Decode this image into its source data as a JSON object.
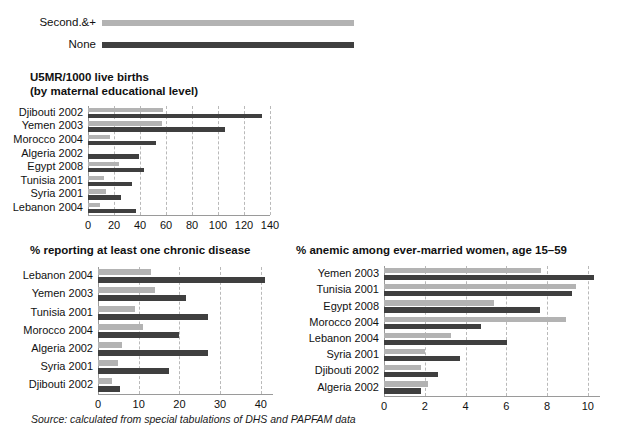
{
  "legend": {
    "items": [
      {
        "label": "Second.&+",
        "style": "light",
        "color": "#b3b3b3"
      },
      {
        "label": "None",
        "style": "dark",
        "color": "#3f3f3f"
      }
    ]
  },
  "source": {
    "text": "Source: calculated from special tabulations of DHS and PAPFAM data"
  },
  "colors": {
    "light_bar": "#b3b3b3",
    "dark_bar": "#3f3f3f",
    "gridline": "#b9b9b9",
    "axis": "#9a9a9a"
  },
  "charts": {
    "u5mr": {
      "title_line1": "U5MR/1000 live births",
      "title_line2": "(by maternal educational level)",
      "categories": [
        "Djibouti 2002",
        "Yemen 2003",
        "Morocco 2004",
        "Algeria 2002",
        "Egypt 2008",
        "Tunisia 2001",
        "Syria 2001",
        "Lebanon 2004"
      ],
      "ticks": [
        "0",
        "20",
        "40",
        "60",
        "80",
        "100",
        "120",
        "140"
      ],
      "tick_values": [
        0,
        20,
        40,
        60,
        80,
        100,
        120,
        140
      ],
      "xmin": 0,
      "xmax": 140,
      "series": [
        {
          "name": "Second.&+",
          "style": "light",
          "values": [
            58,
            57,
            17,
            1,
            24,
            12,
            14,
            9
          ]
        },
        {
          "name": "None",
          "style": "dark",
          "values": [
            134,
            105,
            52,
            39,
            43,
            34,
            25,
            37
          ]
        }
      ]
    },
    "chronic": {
      "title_line1": "% reporting at least one chronic disease",
      "title_line2": "",
      "categories": [
        "Lebanon 2004",
        "Yemen 2003",
        "Tunisia 2001",
        "Morocco 2004",
        "Algeria 2002",
        "Syria 2001",
        "Djibouti 2002"
      ],
      "ticks": [
        "0",
        "10",
        "20",
        "30",
        "40"
      ],
      "tick_values": [
        0,
        10,
        20,
        30,
        40
      ],
      "xmin": 0,
      "xmax": 43,
      "series": [
        {
          "name": "Second.&+",
          "style": "light",
          "values": [
            13,
            14,
            9,
            11,
            6,
            5,
            3.5
          ]
        },
        {
          "name": "None",
          "style": "dark",
          "values": [
            41,
            21.5,
            27,
            20,
            27,
            17.5,
            5.5
          ]
        }
      ]
    },
    "anemia": {
      "title_line1": "% anemic among ever-married women, age 15–59",
      "title_line2": "",
      "categories": [
        "Yemen 2003",
        "Tunisia 2001",
        "Egypt 2008",
        "Morocco 2004",
        "Lebanon 2004",
        "Syria 2001",
        "Djibouti 2002",
        "Algeria 2002"
      ],
      "ticks": [
        "0",
        "2",
        "4",
        "6",
        "8",
        "10"
      ],
      "tick_values": [
        0,
        2,
        4,
        6,
        8,
        10
      ],
      "xmin": 0,
      "xmax": 10.6,
      "series": [
        {
          "name": "Second.&+",
          "style": "light",
          "values": [
            7.7,
            9.4,
            5.4,
            8.95,
            3.3,
            2.0,
            1.8,
            2.15
          ]
        },
        {
          "name": "None",
          "style": "dark",
          "values": [
            10.3,
            9.25,
            7.65,
            4.75,
            6.05,
            3.75,
            2.65,
            1.8
          ]
        }
      ]
    }
  },
  "chart_data": [
    {
      "type": "bar",
      "orientation": "horizontal",
      "title": "U5MR/1000 live births (by maternal educational level)",
      "xlabel": "",
      "ylabel": "",
      "xlim": [
        0,
        140
      ],
      "grid": true,
      "legend_position": "top",
      "categories": [
        "Djibouti 2002",
        "Yemen 2003",
        "Morocco 2004",
        "Algeria 2002",
        "Egypt 2008",
        "Tunisia 2001",
        "Syria 2001",
        "Lebanon 2004"
      ],
      "tick_labels": [
        "0",
        "20",
        "40",
        "60",
        "80",
        "100",
        "120",
        "140"
      ],
      "series": [
        {
          "name": "Second.&+",
          "values": [
            58,
            57,
            17,
            1,
            24,
            12,
            14,
            9
          ]
        },
        {
          "name": "None",
          "values": [
            134,
            105,
            52,
            39,
            43,
            34,
            25,
            37
          ]
        }
      ]
    },
    {
      "type": "bar",
      "orientation": "horizontal",
      "title": "% reporting at least one chronic disease",
      "xlabel": "",
      "ylabel": "",
      "xlim": [
        0,
        43
      ],
      "grid": true,
      "legend_position": "top",
      "categories": [
        "Lebanon 2004",
        "Yemen 2003",
        "Tunisia 2001",
        "Morocco 2004",
        "Algeria 2002",
        "Syria 2001",
        "Djibouti 2002"
      ],
      "tick_labels": [
        "0",
        "10",
        "20",
        "30",
        "40"
      ],
      "series": [
        {
          "name": "Second.&+",
          "values": [
            13,
            14,
            9,
            11,
            6,
            5,
            3.5
          ]
        },
        {
          "name": "None",
          "values": [
            41,
            21.5,
            27,
            20,
            27,
            17.5,
            5.5
          ]
        }
      ]
    },
    {
      "type": "bar",
      "orientation": "horizontal",
      "title": "% anemic among ever-married women, age 15–59",
      "xlabel": "",
      "ylabel": "",
      "xlim": [
        0,
        10.6
      ],
      "grid": true,
      "legend_position": "top",
      "categories": [
        "Yemen 2003",
        "Tunisia 2001",
        "Egypt 2008",
        "Morocco 2004",
        "Lebanon 2004",
        "Syria 2001",
        "Djibouti 2002",
        "Algeria 2002"
      ],
      "tick_labels": [
        "0",
        "2",
        "4",
        "6",
        "8",
        "10"
      ],
      "series": [
        {
          "name": "Second.&+",
          "values": [
            7.7,
            9.4,
            5.4,
            8.95,
            3.3,
            2.0,
            1.8,
            2.15
          ]
        },
        {
          "name": "None",
          "values": [
            10.3,
            9.25,
            7.65,
            4.75,
            6.05,
            3.75,
            2.65,
            1.8
          ]
        }
      ]
    }
  ]
}
